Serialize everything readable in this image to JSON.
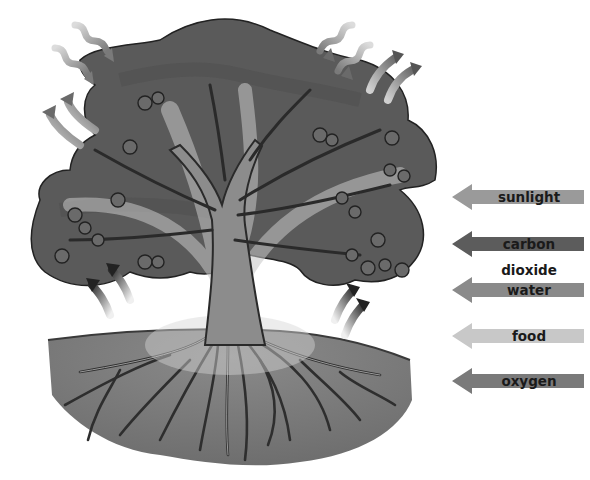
{
  "diagram": {
    "colors": {
      "background": "#ffffff",
      "canopy": "#5a5a5a",
      "canopy_dark": "#333333",
      "trunk": "#8c8c8c",
      "soil": "#7a7a7a",
      "root": "#3a3a3a",
      "flow_highlight": "#bdbdbd"
    }
  },
  "legend": {
    "items": [
      {
        "label": "sunlight",
        "color": "#9a9a9a",
        "style": "wavy"
      },
      {
        "label": "carbon dioxide",
        "color": "#5c5c5c",
        "style": "curved"
      },
      {
        "label": "water",
        "color": "#8a8a8a",
        "style": "curved"
      },
      {
        "label": "food",
        "color": "#c8c8c8",
        "style": "band"
      },
      {
        "label": "oxygen",
        "color": "#7a7a7a",
        "style": "curved"
      }
    ]
  }
}
